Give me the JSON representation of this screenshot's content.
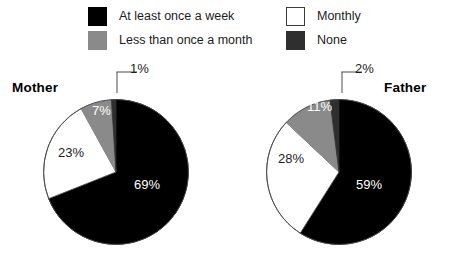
{
  "legend": {
    "items": [
      {
        "key": "week",
        "label": "At least once a week",
        "swatch": "black",
        "color": "#000000"
      },
      {
        "key": "monthly",
        "label": "Monthly",
        "swatch": "white",
        "color": "#ffffff"
      },
      {
        "key": "less",
        "label": "Less than once a month",
        "swatch": "gray",
        "color": "#8a8a8a"
      },
      {
        "key": "none",
        "label": "None",
        "swatch": "dark",
        "color": "#2f2f2f"
      }
    ]
  },
  "charts": {
    "mother": {
      "title": "Mother",
      "labels": {
        "week": "69%",
        "monthly": "23%",
        "less": "7%",
        "none": "1%"
      }
    },
    "father": {
      "title": "Father",
      "labels": {
        "week": "59%",
        "monthly": "28%",
        "less": "11%",
        "none": "2%"
      }
    }
  },
  "chart_data": [
    {
      "type": "pie",
      "title": "Mother",
      "categories": [
        "At least once a week",
        "Monthly",
        "Less than once a month",
        "None"
      ],
      "values": [
        69,
        23,
        7,
        1
      ],
      "value_labels": [
        "69%",
        "23%",
        "7%",
        "1%"
      ],
      "colors": [
        "#000000",
        "#ffffff",
        "#8a8a8a",
        "#2f2f2f"
      ],
      "units": "percent",
      "start_angle_deg": 0,
      "direction": "clockwise",
      "legend": "top",
      "grid": false
    },
    {
      "type": "pie",
      "title": "Father",
      "categories": [
        "At least once a week",
        "Monthly",
        "Less than once a month",
        "None"
      ],
      "values": [
        59,
        28,
        11,
        2
      ],
      "value_labels": [
        "59%",
        "28%",
        "11%",
        "2%"
      ],
      "colors": [
        "#000000",
        "#ffffff",
        "#8a8a8a",
        "#2f2f2f"
      ],
      "units": "percent",
      "start_angle_deg": 0,
      "direction": "clockwise",
      "legend": "top",
      "grid": false
    }
  ]
}
